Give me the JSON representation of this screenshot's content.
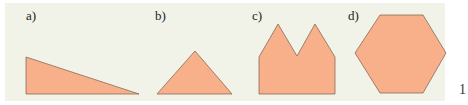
{
  "figure": {
    "background_color": "#f1f3e9",
    "fill_color": "#f7b08a",
    "stroke_color": "#8a6a55",
    "shapes": [
      {
        "label": "a)",
        "name": "right-triangle"
      },
      {
        "label": "b)",
        "name": "triangle"
      },
      {
        "label": "c)",
        "name": "double-peak-polygon"
      },
      {
        "label": "d)",
        "name": "hexagon"
      }
    ]
  },
  "page_number": "1"
}
